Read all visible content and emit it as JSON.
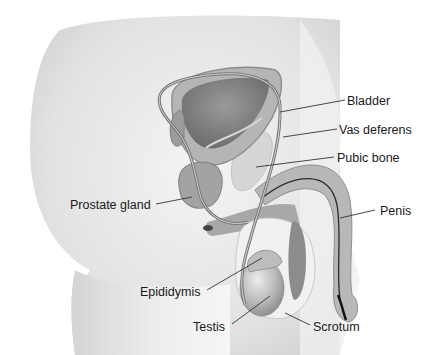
{
  "diagram": {
    "type": "anatomical-illustration",
    "labels": [
      {
        "id": "bladder",
        "text": "Bladder"
      },
      {
        "id": "vas-deferens",
        "text": "Vas deferens"
      },
      {
        "id": "pubic-bone",
        "text": "Pubic bone"
      },
      {
        "id": "prostate-gland",
        "text": "Prostate gland"
      },
      {
        "id": "penis",
        "text": "Penis"
      },
      {
        "id": "epididymis",
        "text": "Epididymis"
      },
      {
        "id": "testis",
        "text": "Testis"
      },
      {
        "id": "scrotum",
        "text": "Scrotum"
      }
    ]
  },
  "colors": {
    "background": "#ffffff",
    "body_fill": "#e4e4e4",
    "organ_dark": "#8f8f8f",
    "organ_mid": "#a8a8a8",
    "organ_light": "#c9c9c9",
    "bone": "#d6d6d6",
    "label_text": "#1a1a1a"
  }
}
